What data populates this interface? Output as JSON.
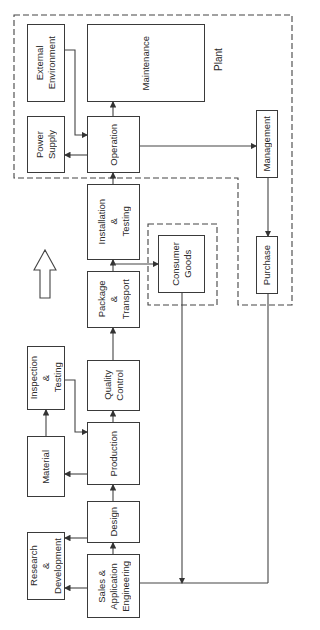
{
  "diagram": {
    "orientation": "rotated 90° counter-clockwise (read bottom-to-top)",
    "groups": {
      "plant": {
        "label": "Plant"
      },
      "consumer": {
        "label": ""
      },
      "management_group": {
        "label": ""
      }
    },
    "boxes": {
      "external_environment": "External\nEnvironment",
      "maintenance": "Maintenance",
      "power_supply": "Power\nSupply",
      "operation": "Operation",
      "management": "Management",
      "installation_testing": "Installation\n&\nTesting",
      "consumer_goods": "Consumer\nGoods",
      "purchase": "Purchase",
      "package_transport": "Package\n&\nTransport",
      "inspection_testing": "Inspection\n&\nTesting",
      "quality_control": "Quality\nControl",
      "material": "Material",
      "production": "Production",
      "design": "Design",
      "research_development": "Research\n&\nDevelopment",
      "sales_engineering": "Sales &\nApplication\nEngineering"
    },
    "flow_direction_icon": "hollow-up-arrow",
    "connections": [
      [
        "sales_engineering",
        "design"
      ],
      [
        "sales_engineering",
        "research_development"
      ],
      [
        "design",
        "research_development"
      ],
      [
        "design",
        "production"
      ],
      [
        "production",
        "material"
      ],
      [
        "material",
        "inspection_testing"
      ],
      [
        "inspection_testing",
        "production"
      ],
      [
        "production",
        "quality_control"
      ],
      [
        "quality_control",
        "package_transport"
      ],
      [
        "package_transport",
        "installation_testing"
      ],
      [
        "package_transport",
        "consumer_goods"
      ],
      [
        "installation_testing",
        "operation"
      ],
      [
        "operation",
        "maintenance"
      ],
      [
        "operation",
        "power_supply"
      ],
      [
        "external_environment",
        "operation"
      ],
      [
        "operation",
        "management"
      ],
      [
        "management",
        "purchase"
      ],
      [
        "consumer_goods",
        "sales_engineering"
      ],
      [
        "purchase",
        "sales_engineering"
      ]
    ]
  }
}
